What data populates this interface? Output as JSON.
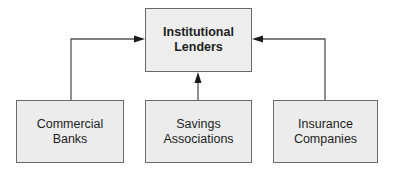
{
  "diagram": {
    "type": "hierarchy",
    "top": {
      "label": "Institutional\nLenders"
    },
    "children": [
      {
        "label": "Commercial\nBanks"
      },
      {
        "label": "Savings\nAssociations"
      },
      {
        "label": "Insurance\nCompanies"
      }
    ],
    "edges": [
      {
        "from": "Commercial Banks",
        "to": "Institutional Lenders"
      },
      {
        "from": "Savings Associations",
        "to": "Institutional Lenders"
      },
      {
        "from": "Insurance Companies",
        "to": "Institutional Lenders"
      }
    ],
    "colors": {
      "box_fill": "#ececec",
      "box_border": "#6a6a6a",
      "line": "#555555",
      "arrow": "#1a1a1a"
    }
  }
}
